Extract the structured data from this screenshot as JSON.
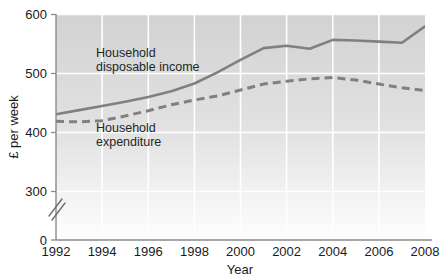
{
  "chart_data": {
    "type": "line",
    "title": "",
    "subtitle": "",
    "xlabel": "Year",
    "ylabel": "£ per week",
    "xlim": [
      1992,
      2008
    ],
    "ylim": [
      0,
      600
    ],
    "y_axis_break": true,
    "y_break_note": "axis broken between 0 and 300",
    "grid": true,
    "grid_color": "#ffffff",
    "legend_position": "inline-annotations",
    "x_ticks": [
      "1992",
      "1994",
      "1996",
      "1998",
      "2000",
      "2002",
      "2004",
      "2006",
      "2008"
    ],
    "x_tick_values": [
      1992,
      1994,
      1996,
      1998,
      2000,
      2002,
      2004,
      2006,
      2008
    ],
    "y_ticks": [
      "0",
      "300",
      "400",
      "500",
      "600"
    ],
    "y_tick_values": [
      0,
      300,
      400,
      500,
      600
    ],
    "x": [
      1992,
      1993,
      1994,
      1995,
      1996,
      1997,
      1998,
      1999,
      2000,
      2001,
      2002,
      2003,
      2004,
      2005,
      2006,
      2007,
      2008
    ],
    "series": [
      {
        "name": "Household disposable income",
        "style": "solid",
        "color": "#808080",
        "values": [
          431,
          438,
          445,
          452,
          460,
          470,
          483,
          502,
          523,
          543,
          547,
          542,
          557,
          556,
          554,
          552,
          580
        ]
      },
      {
        "name": "Household expenditure",
        "style": "dashed",
        "color": "#808080",
        "values": [
          419,
          418,
          420,
          428,
          437,
          447,
          455,
          462,
          472,
          482,
          487,
          491,
          493,
          489,
          482,
          476,
          471
        ]
      }
    ],
    "annotations": [
      {
        "name": "income-label",
        "lines": [
          "Household",
          "disposable income"
        ],
        "x_px": 96,
        "y_px": 52
      },
      {
        "name": "expenditure-label",
        "lines": [
          "Household",
          "expenditure"
        ],
        "x_px": 96,
        "y_px": 127
      }
    ]
  },
  "axis": {
    "x_title": "Year",
    "y_title": "£ per week"
  },
  "ticks": {
    "x": [
      "1992",
      "1994",
      "1996",
      "1998",
      "2000",
      "2002",
      "2004",
      "2006",
      "2008"
    ],
    "y": [
      "600",
      "500",
      "400",
      "300",
      "0"
    ]
  },
  "annotations": {
    "income_line1": "Household",
    "income_line2": "disposable income",
    "expenditure_line1": "Household",
    "expenditure_line2": "expenditure"
  },
  "colors": {
    "line": "#808080",
    "plot_top": "#d4d4d4",
    "plot_bottom": "#fdfdfd",
    "grid": "#ffffff",
    "axis": "#8a8a8a",
    "text": "#1a1a1a"
  }
}
